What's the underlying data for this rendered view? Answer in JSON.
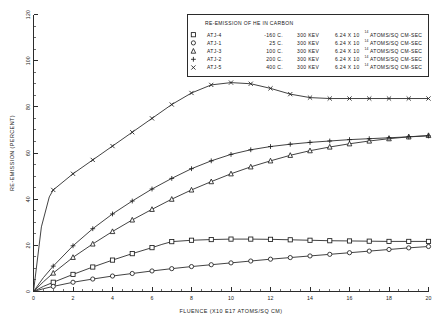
{
  "chart_data": {
    "type": "line",
    "title": "RE-EMISSION OF HE IN CARBON",
    "xlabel": "FLUENCE (X10 E17 ATOMS/SQ CM)",
    "ylabel": "RE-EMISSION (PERCENT)",
    "xlim": [
      0,
      20
    ],
    "ylim": [
      0,
      120
    ],
    "xticks": [
      0,
      2,
      4,
      6,
      8,
      10,
      12,
      14,
      16,
      18,
      20
    ],
    "xtick_labels": [
      "0",
      "2",
      "4",
      "6",
      "8",
      "10",
      "12",
      "14",
      "16",
      "18",
      "20"
    ],
    "yticks": [
      0,
      20,
      40,
      60,
      80,
      100,
      120
    ],
    "ytick_labels": [
      "0",
      "20",
      "40",
      "60",
      "80",
      "100",
      "120"
    ],
    "x_minor_step": 0.5,
    "y_minor_step": 5,
    "grid": false,
    "legend_position": "top-right-inset",
    "series": [
      {
        "name": "ATJ-4",
        "marker": "square",
        "temperature": "-160 C.",
        "energy": "300 KEV",
        "flux_mantissa": "6.24 X 10",
        "flux_exponent": "14",
        "flux_units": "ATOMS/SQ CM-SEC",
        "x": [
          0,
          0.5,
          1,
          2,
          3,
          4,
          5,
          6,
          6.5,
          7,
          8,
          9,
          10,
          11,
          12,
          13,
          14,
          15,
          16,
          17,
          18,
          19,
          20
        ],
        "y": [
          0,
          2.2,
          4.0,
          7.4,
          10.6,
          13.6,
          16.4,
          19.0,
          20.4,
          21.6,
          22.2,
          22.5,
          22.7,
          22.7,
          22.6,
          22.4,
          22.2,
          22.0,
          21.9,
          21.8,
          21.7,
          21.7,
          21.7
        ]
      },
      {
        "name": "ATJ-1",
        "marker": "circle",
        "temperature": "25 C.",
        "energy": "300 KEV",
        "flux_mantissa": "6.24 X 10",
        "flux_exponent": "14",
        "flux_units": "ATOMS/SQ CM-SEC",
        "x": [
          0,
          0.5,
          1,
          2,
          3,
          4,
          5,
          6,
          7,
          8,
          9,
          10,
          11,
          12,
          13,
          14,
          15,
          16,
          17,
          18,
          19,
          20
        ],
        "y": [
          0,
          1.2,
          2.2,
          4.0,
          5.4,
          6.7,
          7.8,
          8.9,
          9.9,
          10.8,
          11.6,
          12.4,
          13.2,
          14.0,
          14.7,
          15.4,
          16.1,
          16.8,
          17.5,
          18.2,
          18.9,
          19.5
        ]
      },
      {
        "name": "ATJ-3",
        "marker": "triangle",
        "temperature": "100 C.",
        "energy": "300 KEV",
        "flux_mantissa": "6.24 X 10",
        "flux_exponent": "14",
        "flux_units": "ATOMS/SQ CM-SEC",
        "x": [
          0,
          0.5,
          1,
          2,
          3,
          4,
          5,
          6,
          7,
          8,
          9,
          10,
          11,
          12,
          13,
          14,
          15,
          16,
          17,
          18,
          19,
          20
        ],
        "y": [
          0,
          4.2,
          8.0,
          14.8,
          20.6,
          26.0,
          31.0,
          35.6,
          40.0,
          44.0,
          47.6,
          51.0,
          54.0,
          56.6,
          59.0,
          61.0,
          62.6,
          64.0,
          65.2,
          66.2,
          67.0,
          67.6
        ]
      },
      {
        "name": "ATJ-2",
        "marker": "plus",
        "temperature": "200 C.",
        "energy": "300 KEV",
        "flux_mantissa": "6.24 X 10",
        "flux_exponent": "14",
        "flux_units": "ATOMS/SQ CM-SEC",
        "x": [
          0,
          0.5,
          1,
          2,
          3,
          4,
          5,
          6,
          7,
          8,
          9,
          10,
          11,
          12,
          13,
          14,
          15,
          16,
          17,
          18,
          19,
          20
        ],
        "y": [
          0,
          6.0,
          11.0,
          19.8,
          27.2,
          33.6,
          39.2,
          44.4,
          49.0,
          53.2,
          56.6,
          59.4,
          61.4,
          62.8,
          63.8,
          64.6,
          65.2,
          65.8,
          66.2,
          66.6,
          67.0,
          67.4
        ]
      },
      {
        "name": "ATJ-5",
        "marker": "cross",
        "temperature": "400 C.",
        "energy": "300 KEV",
        "flux_mantissa": "6.24 X 10",
        "flux_exponent": "14",
        "flux_units": "ATOMS/SQ CM-SEC",
        "x": [
          0,
          0.4,
          0.8,
          1,
          2,
          3,
          4,
          5,
          6,
          7,
          8,
          9,
          10,
          11,
          12,
          13,
          14,
          15,
          16,
          17,
          18,
          19,
          20
        ],
        "y": [
          0,
          28.0,
          41.0,
          44.0,
          51.0,
          57.0,
          63.0,
          69.0,
          75.0,
          81.0,
          86.0,
          89.5,
          90.5,
          90.0,
          88.0,
          85.5,
          84.0,
          83.6,
          83.6,
          83.6,
          83.6,
          83.6,
          83.6
        ]
      }
    ],
    "legend_headers": {
      "symbol": "",
      "sample": "",
      "temperature": "",
      "energy": "",
      "flux": ""
    }
  }
}
